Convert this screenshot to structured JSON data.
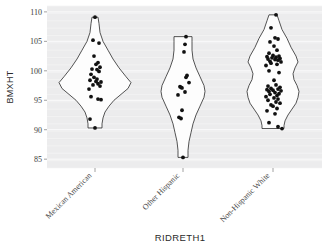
{
  "chart_data": {
    "type": "violin",
    "title": "",
    "xlabel": "RIDRETH1",
    "ylabel": "BMXHT",
    "ylim": [
      83.5,
      111
    ],
    "yticks": [
      85,
      90,
      95,
      100,
      105,
      110
    ],
    "ytick_labels": [
      "85",
      "90",
      "95",
      "100",
      "105",
      "110"
    ],
    "grid": true,
    "legend": "none",
    "categories": [
      "Mexican American",
      "Other Hispanic",
      "Non-Hispanic White"
    ],
    "groups": [
      {
        "name": "Mexican American",
        "center_x": 95,
        "min": 90.3,
        "max": 109.1,
        "n": 25,
        "values": [
          109.1,
          105.2,
          104.7,
          102.5,
          101.4,
          101.1,
          100.6,
          100.3,
          100.2,
          99.9,
          99.4,
          98.9,
          98.6,
          98.4,
          98.2,
          98.1,
          97.8,
          97.6,
          97.4,
          96.9,
          95.6,
          95.2,
          95.1,
          91.8,
          90.3
        ],
        "jitter": [
          0,
          -2,
          4,
          -1,
          3,
          1,
          5,
          -3,
          2,
          4,
          -4,
          -1,
          2,
          -5,
          1,
          6,
          3,
          -2,
          5,
          -6,
          -4,
          3,
          6,
          -5,
          0
        ],
        "width_profile": [
          {
            "y": 109.1,
            "w": 3
          },
          {
            "y": 108.0,
            "w": 4
          },
          {
            "y": 106.5,
            "w": 5
          },
          {
            "y": 105.0,
            "w": 8
          },
          {
            "y": 103.5,
            "w": 13
          },
          {
            "y": 102.0,
            "w": 18
          },
          {
            "y": 100.5,
            "w": 24
          },
          {
            "y": 99.0,
            "w": 31
          },
          {
            "y": 98.0,
            "w": 36
          },
          {
            "y": 97.0,
            "w": 33
          },
          {
            "y": 96.0,
            "w": 26
          },
          {
            "y": 95.0,
            "w": 19
          },
          {
            "y": 94.0,
            "w": 14
          },
          {
            "y": 93.0,
            "w": 10
          },
          {
            "y": 92.0,
            "w": 8
          },
          {
            "y": 91.0,
            "w": 7
          },
          {
            "y": 90.3,
            "w": 7
          }
        ]
      },
      {
        "name": "Other Hispanic",
        "center_x": 183,
        "min": 85.3,
        "max": 105.8,
        "n": 14,
        "values": [
          105.8,
          104.5,
          103.2,
          99.2,
          98.9,
          98.0,
          97.3,
          97.2,
          97.1,
          96.4,
          95.9,
          93.3,
          92.1,
          91.9,
          85.3
        ],
        "jitter": [
          3,
          2,
          1,
          4,
          3,
          6,
          -3,
          -2,
          -1,
          2,
          -5,
          -1,
          -4,
          -2,
          0
        ],
        "width_profile": [
          {
            "y": 105.8,
            "w": 9
          },
          {
            "y": 105.0,
            "w": 9
          },
          {
            "y": 103.5,
            "w": 9
          },
          {
            "y": 102.0,
            "w": 10
          },
          {
            "y": 100.5,
            "w": 13
          },
          {
            "y": 99.0,
            "w": 17
          },
          {
            "y": 97.5,
            "w": 21
          },
          {
            "y": 96.5,
            "w": 22
          },
          {
            "y": 95.5,
            "w": 21
          },
          {
            "y": 94.0,
            "w": 17
          },
          {
            "y": 92.5,
            "w": 13
          },
          {
            "y": 91.0,
            "w": 10
          },
          {
            "y": 89.5,
            "w": 8
          },
          {
            "y": 88.0,
            "w": 6
          },
          {
            "y": 86.5,
            "w": 5
          },
          {
            "y": 85.3,
            "w": 5
          }
        ]
      },
      {
        "name": "Non-Hispanic White",
        "center_x": 273,
        "min": 90.2,
        "max": 109.5,
        "n": 52,
        "values": [
          109.5,
          107.3,
          105.6,
          105.4,
          104.9,
          104.2,
          103.5,
          103.0,
          102.6,
          102.5,
          102.4,
          102.3,
          102.2,
          102.1,
          102.0,
          101.9,
          101.8,
          101.6,
          101.5,
          101.3,
          101.1,
          100.9,
          100.0,
          99.7,
          98.4,
          97.6,
          97.4,
          97.2,
          97.0,
          96.9,
          96.8,
          96.7,
          96.6,
          96.5,
          96.3,
          96.1,
          96.0,
          95.8,
          95.6,
          95.4,
          95.2,
          95.0,
          94.7,
          94.5,
          94.2,
          94.0,
          93.6,
          93.2,
          92.7,
          91.2,
          90.5,
          90.2
        ],
        "jitter": [
          3,
          -2,
          2,
          5,
          -3,
          1,
          4,
          -4,
          0,
          6,
          -6,
          3,
          -1,
          7,
          -5,
          2,
          5,
          -3,
          8,
          -2,
          4,
          -7,
          -4,
          6,
          1,
          3,
          -5,
          7,
          -2,
          5,
          -6,
          0,
          8,
          -4,
          2,
          6,
          -3,
          4,
          -7,
          1,
          5,
          -5,
          3,
          7,
          -2,
          0,
          4,
          -6,
          2,
          -4,
          5,
          9
        ],
        "width_profile": [
          {
            "y": 109.5,
            "w": 4
          },
          {
            "y": 108.5,
            "w": 6
          },
          {
            "y": 107.0,
            "w": 9
          },
          {
            "y": 105.5,
            "w": 14
          },
          {
            "y": 104.0,
            "w": 18
          },
          {
            "y": 102.5,
            "w": 23
          },
          {
            "y": 101.5,
            "w": 25
          },
          {
            "y": 100.5,
            "w": 22
          },
          {
            "y": 99.5,
            "w": 20
          },
          {
            "y": 98.5,
            "w": 21
          },
          {
            "y": 97.5,
            "w": 24
          },
          {
            "y": 96.5,
            "w": 26
          },
          {
            "y": 95.5,
            "w": 25
          },
          {
            "y": 94.5,
            "w": 23
          },
          {
            "y": 93.5,
            "w": 19
          },
          {
            "y": 92.5,
            "w": 15
          },
          {
            "y": 91.5,
            "w": 12
          },
          {
            "y": 90.7,
            "w": 11
          },
          {
            "y": 90.2,
            "w": 11
          }
        ]
      }
    ]
  },
  "axes": {
    "y_title": "BMXHT",
    "x_title": "RIDRETH1"
  }
}
